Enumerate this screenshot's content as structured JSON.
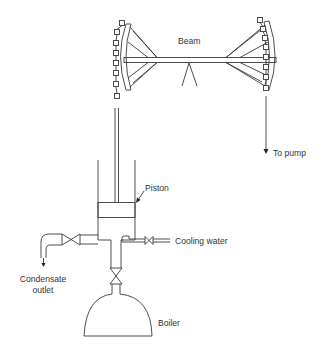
{
  "diagram": {
    "colors": {
      "line": "#3a3a3a",
      "text": "#333333",
      "background": "#ffffff"
    },
    "labels": {
      "beam": "Beam",
      "to_pump": "To pump",
      "piston": "Piston",
      "cooling_water": "Cooling water",
      "condensate_line1": "Condensate",
      "condensate_line2": "outlet",
      "boiler": "Boiler"
    },
    "components": [
      {
        "id": "beam",
        "label": "Beam"
      },
      {
        "id": "pivot",
        "label": ""
      },
      {
        "id": "left-arch-head",
        "label": ""
      },
      {
        "id": "right-arch-head",
        "label": ""
      },
      {
        "id": "left-chain",
        "label": ""
      },
      {
        "id": "right-chain",
        "label": "To pump"
      },
      {
        "id": "cylinder",
        "label": ""
      },
      {
        "id": "piston",
        "label": "Piston"
      },
      {
        "id": "cooling-water-valve",
        "label": "Cooling water"
      },
      {
        "id": "condensate-valve",
        "label": "Condensate outlet"
      },
      {
        "id": "steam-valve",
        "label": ""
      },
      {
        "id": "boiler",
        "label": "Boiler"
      }
    ]
  }
}
